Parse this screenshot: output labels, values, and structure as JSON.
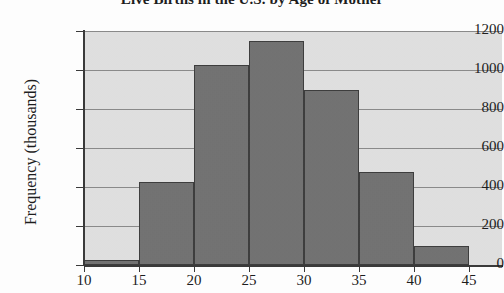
{
  "chart_data": {
    "type": "bar",
    "title": "Live Births in the U.S. by Age of Mother",
    "xlabel": "",
    "ylabel": "Frequency (thousands)",
    "categories": [
      "10-15",
      "15-20",
      "20-25",
      "25-30",
      "30-35",
      "35-40",
      "40-45"
    ],
    "bin_edges": [
      10,
      15,
      20,
      25,
      30,
      35,
      40,
      45
    ],
    "values": [
      25,
      425,
      1025,
      1150,
      900,
      475,
      100
    ],
    "xlim": [
      10,
      48
    ],
    "ylim": [
      0,
      1200
    ],
    "xticks": [
      10,
      15,
      20,
      25,
      30,
      35,
      40,
      45
    ],
    "yticks": [
      0,
      200,
      400,
      600,
      800,
      1000,
      1200
    ],
    "xtick_labels": [
      "10",
      "15",
      "20",
      "25",
      "30",
      "35",
      "40",
      "45"
    ],
    "ytick_labels": [
      "0",
      "200",
      "400",
      "600",
      "800",
      "1000",
      "1200"
    ],
    "grid": "horizontal",
    "legend": "none",
    "bar_color": "#6f6f6f",
    "bar_edge_color": "#3b3b3b",
    "plot_background": "#e3e3e3",
    "axis_color": "#3a3a3a",
    "gridline_color": "#8a8a8a"
  }
}
